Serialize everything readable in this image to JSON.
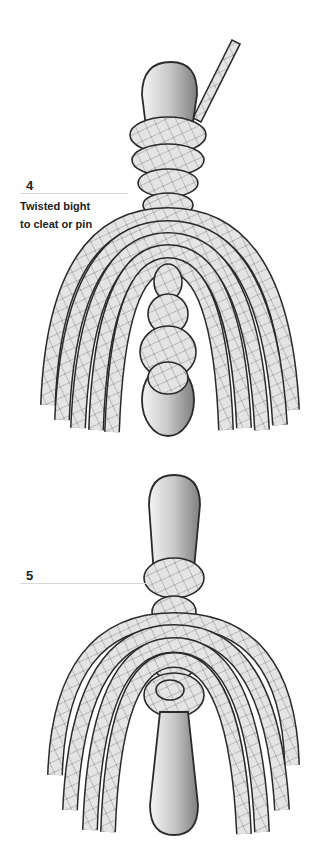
{
  "steps": [
    {
      "number": "4",
      "caption_lines": [
        "Twisted bight",
        "to cleat or pin"
      ]
    },
    {
      "number": "5",
      "caption_lines": []
    }
  ],
  "colors": {
    "outline": "#2a2a2a",
    "rope_fill": "#e6e6e6",
    "rope_weave": "#9a9a9a",
    "pin_light": "#f2f2f2",
    "pin_dark": "#8a8a8a",
    "leader_line": "#d8d8d8"
  }
}
